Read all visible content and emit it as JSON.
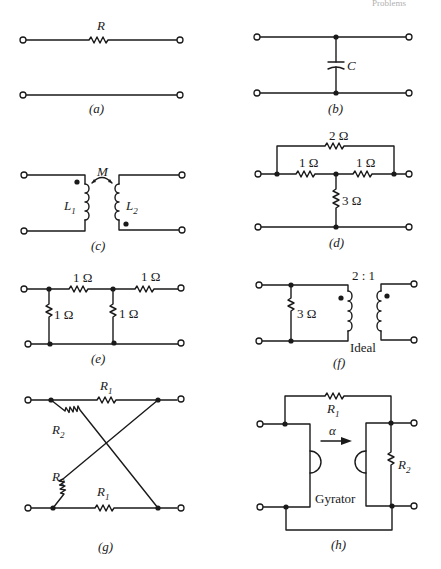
{
  "page": {
    "header_fragment": "Problems"
  },
  "circuits": {
    "a": {
      "caption": "(a)",
      "resistor_label": "R"
    },
    "b": {
      "caption": "(b)",
      "capacitor_label": "C"
    },
    "c": {
      "caption": "(c)",
      "mutual_label": "M",
      "inductor1": {
        "sym": "L",
        "sub": "1"
      },
      "inductor2": {
        "sym": "L",
        "sub": "2"
      }
    },
    "d": {
      "caption": "(d)",
      "top_resistor": "2 Ω",
      "left_resistor": "1 Ω",
      "right_resistor": "1 Ω",
      "shunt_resistor": "3 Ω"
    },
    "e": {
      "caption": "(e)",
      "series1": "1 Ω",
      "series2": "1 Ω",
      "shunt1": "1 Ω",
      "shunt2": "1 Ω"
    },
    "f": {
      "caption": "(f)",
      "shunt_resistor": "3 Ω",
      "turns_ratio": "2 : 1",
      "transformer_type": "Ideal"
    },
    "g": {
      "caption": "(g)",
      "top_r": {
        "sym": "R",
        "sub": "1"
      },
      "bottom_r": {
        "sym": "R",
        "sub": "1"
      },
      "upper_diag_r": {
        "sym": "R",
        "sub": "2"
      },
      "lower_diag_r": {
        "sym": "R",
        "sub": "2"
      }
    },
    "h": {
      "caption": "(h)",
      "r1": {
        "sym": "R",
        "sub": "1"
      },
      "r2": {
        "sym": "R",
        "sub": "2"
      },
      "gyration": "α",
      "device_label": "Gyrator"
    }
  }
}
